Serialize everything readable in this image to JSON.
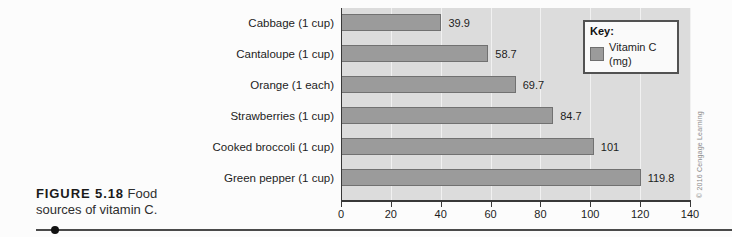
{
  "figure": {
    "caption_bold": "FIGURE 5.18",
    "caption_text": " Food sources of vitamin C.",
    "credit": "© 2016 Cengage Learning"
  },
  "chart_data": {
    "type": "bar",
    "orientation": "horizontal",
    "title": "",
    "xlabel": "",
    "ylabel": "",
    "categories": [
      "Cabbage (1 cup)",
      "Cantaloupe (1 cup)",
      "Orange (1 each)",
      "Strawberries (1 cup)",
      "Cooked broccoli (1 cup)",
      "Green pepper (1 cup)"
    ],
    "values": [
      39.9,
      58.7,
      69.7,
      84.7,
      101,
      119.8
    ],
    "value_labels": [
      "39.9",
      "58.7",
      "69.7",
      "84.7",
      "101",
      "119.8"
    ],
    "xlim": [
      0,
      140
    ],
    "x_ticks": [
      "0",
      "20",
      "40",
      "60",
      "80",
      "100",
      "120",
      "140"
    ],
    "grid": "vertical gridlines every 20 units",
    "legend": {
      "position": "top-right",
      "title": "Key:",
      "entries": [
        {
          "label": "Vitamin C (mg)",
          "swatch_color": "#9b9b9b"
        }
      ]
    },
    "colors": {
      "bar_fill": "#9b9b9b",
      "bar_border": "#717171",
      "plot_background": "#dcdcdc",
      "gridline": "#f1f1f1",
      "axis": "#383838"
    }
  }
}
